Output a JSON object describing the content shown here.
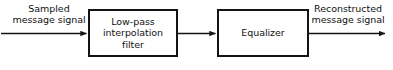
{
  "diagram": {
    "type": "block-diagram",
    "colors": {
      "stroke": "#141414",
      "text": "#121212",
      "background": "#ffffff"
    },
    "input_label": {
      "line1": "Sampled",
      "line2": "message signal"
    },
    "output_label": {
      "line1": "Reconstructed",
      "line2": "message signal"
    },
    "blocks": [
      {
        "id": "filter",
        "line1": "Low-pass",
        "line2": "interpolation",
        "line3": "filter"
      },
      {
        "id": "equalizer",
        "line1": "Equalizer"
      }
    ],
    "connections": [
      {
        "id": "input-arrow",
        "from": "input",
        "to": "filter"
      },
      {
        "id": "filter-to-equalizer-arrow",
        "from": "filter",
        "to": "equalizer"
      },
      {
        "id": "output-arrow",
        "from": "equalizer",
        "to": "output"
      }
    ]
  }
}
